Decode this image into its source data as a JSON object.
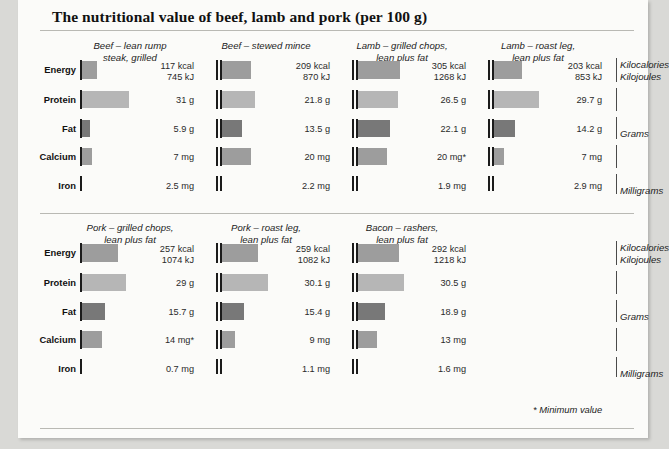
{
  "title": "The nutritional value of beef, lamb and pork (per 100 g)",
  "footnote": "* Minimum value",
  "row_labels": [
    "Energy",
    "Protein",
    "Fat",
    "Calcium",
    "Iron"
  ],
  "legend": {
    "energy_line1": "Kilocalories",
    "energy_line2": "Kilojoules",
    "fat": "Grams",
    "iron": "Milligrams"
  },
  "chart_data": {
    "type": "bar",
    "title": "The nutritional value of beef, lamb and pork (per 100 g)",
    "xlabel": "",
    "ylabel": "",
    "grid": false,
    "legend_position": "right",
    "annotations": [
      "* Minimum value"
    ],
    "units": {
      "Energy": "Kilocalories / Kilojoules",
      "Protein": "Grams",
      "Fat": "Grams",
      "Calcium": "Milligrams",
      "Iron": "Milligrams"
    },
    "categories": [
      "Energy",
      "Protein",
      "Fat",
      "Calcium",
      "Iron"
    ],
    "sections": [
      {
        "columns": [
          {
            "name_line1": "Beef – lean rump",
            "name_line2": "steak, grilled",
            "cells": [
              {
                "row": "Energy",
                "text_line1": "117 kcal",
                "text_line2": "745 kJ",
                "value": 117,
                "value2": 745,
                "bar": 15
              },
              {
                "row": "Protein",
                "text_line1": "31 g",
                "text_line2": "",
                "value": 31,
                "bar": 47
              },
              {
                "row": "Fat",
                "text_line1": "5.9 g",
                "text_line2": "",
                "value": 5.9,
                "bar": 8
              },
              {
                "row": "Calcium",
                "text_line1": "7 mg",
                "text_line2": "",
                "value": 7,
                "bar": 10
              },
              {
                "row": "Iron",
                "text_line1": "2.5 mg",
                "text_line2": "",
                "value": 2.5,
                "bar": 0
              }
            ]
          },
          {
            "name_line1": "Beef – stewed mince",
            "name_line2": "",
            "cells": [
              {
                "row": "Energy",
                "text_line1": "209 kcal",
                "text_line2": "870 kJ",
                "value": 209,
                "value2": 870,
                "bar": 29
              },
              {
                "row": "Protein",
                "text_line1": "21.8 g",
                "text_line2": "",
                "value": 21.8,
                "bar": 33
              },
              {
                "row": "Fat",
                "text_line1": "13.5 g",
                "text_line2": "",
                "value": 13.5,
                "bar": 20
              },
              {
                "row": "Calcium",
                "text_line1": "20 mg",
                "text_line2": "",
                "value": 20,
                "bar": 29
              },
              {
                "row": "Iron",
                "text_line1": "2.2 mg",
                "text_line2": "",
                "value": 2.2,
                "bar": 0
              }
            ]
          },
          {
            "name_line1": "Lamb – grilled chops,",
            "name_line2": "lean plus fat",
            "cells": [
              {
                "row": "Energy",
                "text_line1": "305 kcal",
                "text_line2": "1268 kJ",
                "value": 305,
                "value2": 1268,
                "bar": 42
              },
              {
                "row": "Protein",
                "text_line1": "26.5 g",
                "text_line2": "",
                "value": 26.5,
                "bar": 40
              },
              {
                "row": "Fat",
                "text_line1": "22.1 g",
                "text_line2": "",
                "value": 22.1,
                "bar": 32
              },
              {
                "row": "Calcium",
                "text_line1": "20 mg*",
                "text_line2": "",
                "value": 20,
                "bar": 29
              },
              {
                "row": "Iron",
                "text_line1": "1.9 mg",
                "text_line2": "",
                "value": 1.9,
                "bar": 0
              }
            ]
          },
          {
            "name_line1": "Lamb – roast leg,",
            "name_line2": "lean plus fat",
            "cells": [
              {
                "row": "Energy",
                "text_line1": "203 kcal",
                "text_line2": "853 kJ",
                "value": 203,
                "value2": 853,
                "bar": 28
              },
              {
                "row": "Protein",
                "text_line1": "29.7 g",
                "text_line2": "",
                "value": 29.7,
                "bar": 45
              },
              {
                "row": "Fat",
                "text_line1": "14.2 g",
                "text_line2": "",
                "value": 14.2,
                "bar": 21
              },
              {
                "row": "Calcium",
                "text_line1": "7 mg",
                "text_line2": "",
                "value": 7,
                "bar": 10
              },
              {
                "row": "Iron",
                "text_line1": "2.9 mg",
                "text_line2": "",
                "value": 2.9,
                "bar": 0
              }
            ]
          }
        ]
      },
      {
        "columns": [
          {
            "name_line1": "Pork – grilled chops,",
            "name_line2": "lean plus fat",
            "cells": [
              {
                "row": "Energy",
                "text_line1": "257 kcal",
                "text_line2": "1074 kJ",
                "value": 257,
                "value2": 1074,
                "bar": 36
              },
              {
                "row": "Protein",
                "text_line1": "29 g",
                "text_line2": "",
                "value": 29,
                "bar": 44
              },
              {
                "row": "Fat",
                "text_line1": "15.7 g",
                "text_line2": "",
                "value": 15.7,
                "bar": 23
              },
              {
                "row": "Calcium",
                "text_line1": "14 mg*",
                "text_line2": "",
                "value": 14,
                "bar": 20
              },
              {
                "row": "Iron",
                "text_line1": "0.7 mg",
                "text_line2": "",
                "value": 0.7,
                "bar": 0
              }
            ]
          },
          {
            "name_line1": "Pork – roast leg,",
            "name_line2": "lean plus fat",
            "cells": [
              {
                "row": "Energy",
                "text_line1": "259 kcal",
                "text_line2": "1082 kJ",
                "value": 259,
                "value2": 1082,
                "bar": 36
              },
              {
                "row": "Protein",
                "text_line1": "30.1 g",
                "text_line2": "",
                "value": 30.1,
                "bar": 46
              },
              {
                "row": "Fat",
                "text_line1": "15.4 g",
                "text_line2": "",
                "value": 15.4,
                "bar": 22
              },
              {
                "row": "Calcium",
                "text_line1": "9 mg",
                "text_line2": "",
                "value": 9,
                "bar": 13
              },
              {
                "row": "Iron",
                "text_line1": "1.1 mg",
                "text_line2": "",
                "value": 1.1,
                "bar": 0
              }
            ]
          },
          {
            "name_line1": "Bacon – rashers,",
            "name_line2": "lean plus fat",
            "cells": [
              {
                "row": "Energy",
                "text_line1": "292 kcal",
                "text_line2": "1218 kJ",
                "value": 292,
                "value2": 1218,
                "bar": 41
              },
              {
                "row": "Protein",
                "text_line1": "30.5 g",
                "text_line2": "",
                "value": 30.5,
                "bar": 46
              },
              {
                "row": "Fat",
                "text_line1": "18.9 g",
                "text_line2": "",
                "value": 18.9,
                "bar": 27
              },
              {
                "row": "Calcium",
                "text_line1": "13 mg",
                "text_line2": "",
                "value": 13,
                "bar": 19
              },
              {
                "row": "Iron",
                "text_line1": "1.6 mg",
                "text_line2": "",
                "value": 1.6,
                "bar": 0
              }
            ]
          }
        ]
      }
    ],
    "colors": {
      "Energy": "#9d9d9d",
      "Protein": "#b6b6b6",
      "Fat": "#787878",
      "Calcium": "#9d9d9d",
      "Iron": "#9d9d9d"
    }
  }
}
